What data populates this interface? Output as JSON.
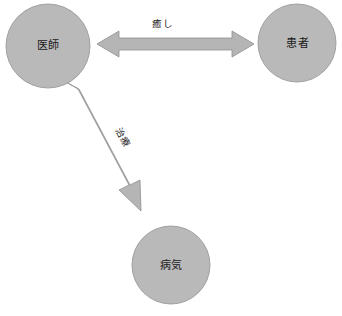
{
  "diagram": {
    "type": "relationship-diagram",
    "background_color": "#ffffff",
    "node_fill_color": "#b9b9b9",
    "node_stroke_color": "#999999",
    "arrow_fill_color": "#b5b5b5",
    "arrow_stroke_color": "#8f8f8f",
    "text_color": "#1a1a1a",
    "nodes": [
      {
        "id": "doctor",
        "label": "医師",
        "shape": "circle",
        "cx": 48,
        "cy": 46,
        "r": 42
      },
      {
        "id": "patient",
        "label": "患者",
        "shape": "circle",
        "cx": 297,
        "cy": 43,
        "r": 39
      },
      {
        "id": "illness",
        "label": "病気",
        "shape": "circle",
        "cx": 171,
        "cy": 265,
        "r": 39
      }
    ],
    "edges": [
      {
        "id": "healing",
        "label": "癒し",
        "from": "doctor",
        "to": "patient",
        "direction": "bidirectional",
        "orientation": "horizontal"
      },
      {
        "id": "treatment",
        "label": "治療",
        "from": "doctor",
        "to": "illness",
        "direction": "unidirectional",
        "orientation": "diagonal",
        "label_rotation_deg": 62
      }
    ],
    "caption": ""
  }
}
